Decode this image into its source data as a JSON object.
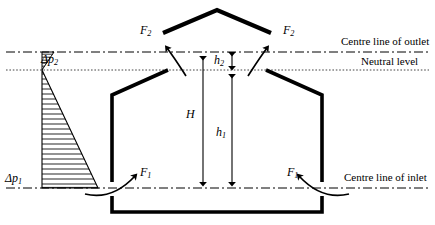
{
  "figure": {
    "kind": "engineering-cross-section",
    "background_color": "#ffffff",
    "stroke_color": "#000000",
    "width": 435,
    "height": 225
  },
  "reference_lines": [
    {
      "id": "outlet",
      "label": "Centre line of outlet",
      "style": "dash-dot",
      "y": 52
    },
    {
      "id": "neutral",
      "label": "Neutral level",
      "style": "dotted",
      "y": 70
    },
    {
      "id": "inlet",
      "label": "Centre line of inlet",
      "style": "dash-dot",
      "y": 188
    }
  ],
  "forces": {
    "outlet_left": {
      "symbol": "F",
      "subscript": "2"
    },
    "outlet_right": {
      "symbol": "F",
      "subscript": "2"
    },
    "inlet_left": {
      "symbol": "F",
      "subscript": "1"
    },
    "inlet_right": {
      "symbol": "F",
      "subscript": "1"
    }
  },
  "dimensions": {
    "total_height": {
      "symbol": "H",
      "subscript": ""
    },
    "below_neutral": {
      "symbol": "h",
      "subscript": "1"
    },
    "above_neutral": {
      "symbol": "h",
      "subscript": "2"
    }
  },
  "pressures": {
    "upper": {
      "symbol": "Δp",
      "subscript": "2"
    },
    "lower": {
      "symbol": "Δp",
      "subscript": "1"
    }
  },
  "pressure_profile": {
    "type": "two-triangle stack pressure distribution",
    "hatch": "horizontal lines",
    "apex_y": 70,
    "upper_triangle": {
      "top_y": 52,
      "apex_y": 70,
      "max_width": 12
    },
    "lower_triangle": {
      "apex_y": 70,
      "bottom_y": 188,
      "max_width": 56
    }
  }
}
